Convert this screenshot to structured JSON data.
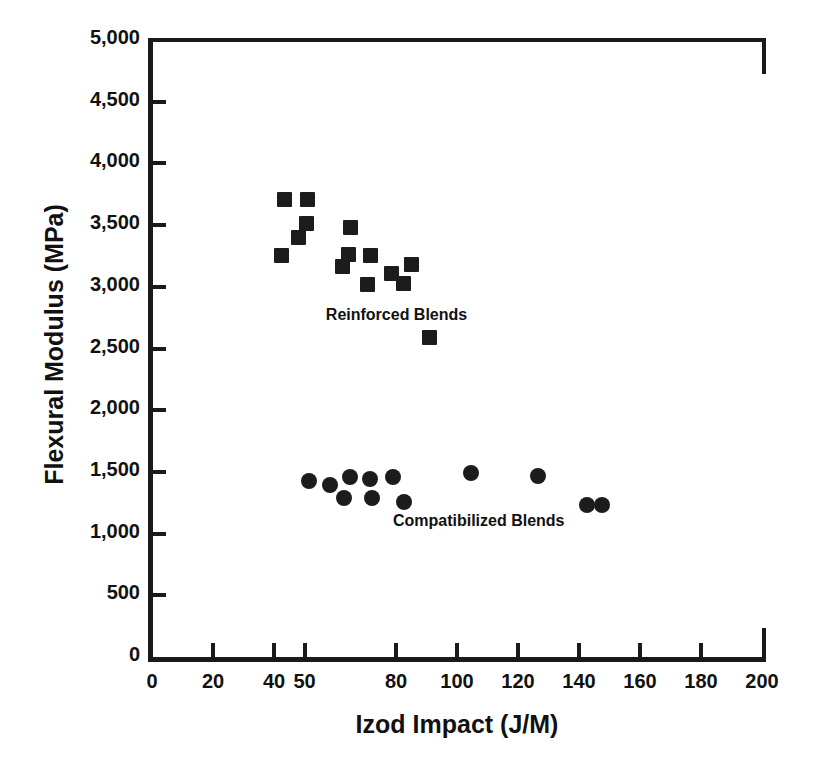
{
  "chart_data": {
    "type": "scatter",
    "title": "",
    "xlabel": "Izod Impact (J/M)",
    "ylabel": "Flexural Modulus (MPa)",
    "xlim": [
      0,
      200
    ],
    "ylim": [
      0,
      5000
    ],
    "grid": false,
    "legend_position": "in-plot annotations",
    "x_ticks": [
      0,
      20,
      40,
      50,
      80,
      100,
      120,
      140,
      160,
      180,
      200
    ],
    "x_tick_labels": [
      "0",
      "20",
      "40",
      "50",
      "80",
      "100",
      "120",
      "140",
      "160",
      "180",
      "200"
    ],
    "y_ticks": [
      0,
      500,
      1000,
      1500,
      2000,
      2500,
      3000,
      3500,
      4000,
      4500,
      5000
    ],
    "y_tick_labels": [
      "0",
      "500",
      "1,000",
      "1,500",
      "2,000",
      "2,500",
      "3,000",
      "3,500",
      "4,000",
      "4,500",
      "5,000"
    ],
    "marker_color": "#1c1c1c",
    "series": [
      {
        "name": "Reinforced Blends",
        "marker": "square",
        "annotation": "Reinforced Blends",
        "annotation_x": 57,
        "annotation_y": 2760,
        "points": [
          {
            "x": 43.5,
            "y": 3710
          },
          {
            "x": 42.5,
            "y": 3250
          },
          {
            "x": 51.0,
            "y": 3710
          },
          {
            "x": 50.5,
            "y": 3510
          },
          {
            "x": 48.0,
            "y": 3400
          },
          {
            "x": 65.0,
            "y": 3480
          },
          {
            "x": 64.5,
            "y": 3260
          },
          {
            "x": 62.5,
            "y": 3165
          },
          {
            "x": 71.5,
            "y": 3250
          },
          {
            "x": 70.5,
            "y": 3020
          },
          {
            "x": 78.5,
            "y": 3110
          },
          {
            "x": 82.5,
            "y": 3030
          },
          {
            "x": 85.0,
            "y": 3180
          },
          {
            "x": 91.0,
            "y": 2590
          }
        ]
      },
      {
        "name": "Compatibilized Blends",
        "marker": "circle",
        "annotation": "Compatibilized Blends",
        "annotation_x": 79,
        "annotation_y": 1090,
        "points": [
          {
            "x": 51.5,
            "y": 1430
          },
          {
            "x": 58.5,
            "y": 1390
          },
          {
            "x": 65.0,
            "y": 1455
          },
          {
            "x": 63.0,
            "y": 1290
          },
          {
            "x": 71.5,
            "y": 1440
          },
          {
            "x": 72.0,
            "y": 1290
          },
          {
            "x": 79.0,
            "y": 1460
          },
          {
            "x": 82.5,
            "y": 1260
          },
          {
            "x": 104.5,
            "y": 1495
          },
          {
            "x": 126.5,
            "y": 1465
          },
          {
            "x": 142.5,
            "y": 1235
          },
          {
            "x": 147.5,
            "y": 1230
          }
        ]
      }
    ]
  }
}
